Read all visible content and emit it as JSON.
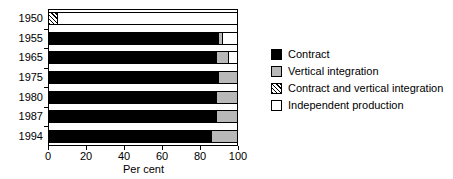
{
  "chart_data": {
    "type": "bar",
    "orientation": "horizontal",
    "stacked": true,
    "title": "",
    "xlabel": "Per cent",
    "ylabel": "",
    "xlim": [
      0,
      100
    ],
    "xticks": [
      0,
      20,
      40,
      60,
      80,
      100
    ],
    "xtick_labels": [
      "0",
      "20",
      "40",
      "60",
      "80",
      "100"
    ],
    "grid": false,
    "legend_position": "right",
    "categories": [
      "1950",
      "1955",
      "1965",
      "1975",
      "1980",
      "1987",
      "1994"
    ],
    "series": [
      {
        "name": "Contract",
        "color": "#000000",
        "values": [
          0,
          90,
          89,
          90,
          89,
          89,
          86
        ]
      },
      {
        "name": "Vertical integration",
        "color": "#b8b8b8",
        "values": [
          0,
          2,
          6,
          10,
          11,
          11,
          14
        ]
      },
      {
        "name": "Contract and vertical integration",
        "color": "hatched",
        "values": [
          4,
          0,
          0,
          0,
          0,
          0,
          0
        ]
      },
      {
        "name": "Independent production",
        "color": "#ffffff",
        "values": [
          96,
          8,
          5,
          0,
          0,
          0,
          0
        ]
      }
    ],
    "bars": [
      {
        "category": "1950",
        "segments": [
          {
            "series": "Contract and vertical integration",
            "value": 4
          },
          {
            "series": "Independent production",
            "value": 96
          }
        ]
      },
      {
        "category": "1955",
        "segments": [
          {
            "series": "Contract",
            "value": 90
          },
          {
            "series": "Vertical integration",
            "value": 2
          },
          {
            "series": "Independent production",
            "value": 8
          }
        ]
      },
      {
        "category": "1965",
        "segments": [
          {
            "series": "Contract",
            "value": 89
          },
          {
            "series": "Vertical integration",
            "value": 6
          },
          {
            "series": "Independent production",
            "value": 5
          }
        ]
      },
      {
        "category": "1975",
        "segments": [
          {
            "series": "Contract",
            "value": 90
          },
          {
            "series": "Vertical integration",
            "value": 10
          }
        ]
      },
      {
        "category": "1980",
        "segments": [
          {
            "series": "Contract",
            "value": 89
          },
          {
            "series": "Vertical integration",
            "value": 11
          }
        ]
      },
      {
        "category": "1987",
        "segments": [
          {
            "series": "Contract",
            "value": 89
          },
          {
            "series": "Vertical integration",
            "value": 11
          }
        ]
      },
      {
        "category": "1994",
        "segments": [
          {
            "series": "Contract",
            "value": 86
          },
          {
            "series": "Vertical integration",
            "value": 14
          }
        ]
      }
    ]
  },
  "axis": {
    "x_title": "Per cent",
    "x_tick_labels": [
      "0",
      "20",
      "40",
      "60",
      "80",
      "100"
    ],
    "y_tick_labels": [
      "1950",
      "1955",
      "1965",
      "1975",
      "1980",
      "1987",
      "1994"
    ]
  },
  "legend": {
    "items": [
      {
        "label": "Contract",
        "swatch": "contract"
      },
      {
        "label": "Vertical integration",
        "swatch": "vertical"
      },
      {
        "label": "Contract and vertical integration",
        "swatch": "both"
      },
      {
        "label": "Independent production",
        "swatch": "independent"
      }
    ]
  }
}
